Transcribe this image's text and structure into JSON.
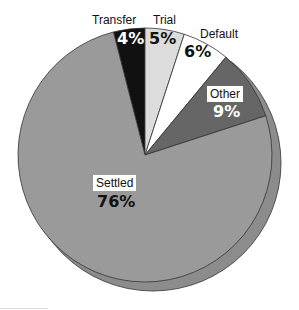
{
  "chart_data": {
    "type": "pie",
    "title": "",
    "categories": [
      "Transfer",
      "Trial",
      "Default",
      "Other",
      "Settled"
    ],
    "values": [
      4,
      5,
      6,
      9,
      76
    ],
    "value_labels": [
      "4%",
      "5%",
      "6%",
      "9%",
      "76%"
    ],
    "colors": [
      "#111111",
      "#dcdcdc",
      "#ffffff",
      "#666666",
      "#9a9a9a"
    ],
    "start_angle_deg": -14.4,
    "direction": "clockwise",
    "legend": "none (direct labels)",
    "shadow_color": "#8c8c8c"
  },
  "labels": {
    "transfer": {
      "name": "Transfer",
      "pct": "4%"
    },
    "trial": {
      "name": "Trial",
      "pct": "5%"
    },
    "default": {
      "name": "Default",
      "pct": "6%"
    },
    "other": {
      "name": "Other",
      "pct": "9%"
    },
    "settled": {
      "name": "Settled",
      "pct": "76%"
    }
  }
}
